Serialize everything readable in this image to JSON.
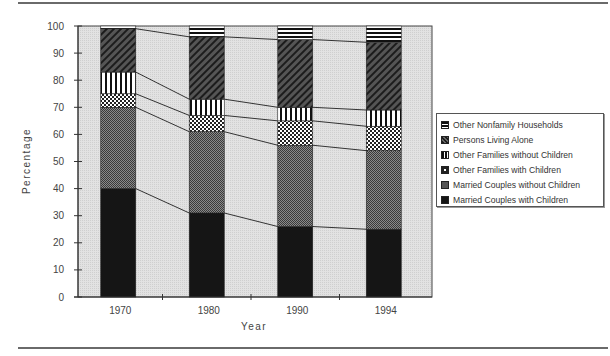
{
  "chart_data": {
    "type": "bar",
    "stacked": true,
    "percent": true,
    "title": "",
    "xlabel": "Year",
    "ylabel": "Percentage",
    "ylim": [
      0,
      100
    ],
    "yticks": [
      0,
      10,
      20,
      30,
      40,
      50,
      60,
      70,
      80,
      90,
      100
    ],
    "categories": [
      "1970",
      "1980",
      "1990",
      "1994"
    ],
    "series": [
      {
        "name": "Married Couples with Children",
        "values": [
          40,
          31,
          26,
          25
        ]
      },
      {
        "name": "Married Couples without Children",
        "values": [
          30,
          30,
          30,
          29
        ]
      },
      {
        "name": "Other Families with Children",
        "values": [
          5,
          6,
          9,
          9
        ]
      },
      {
        "name": "Other Families without Children",
        "values": [
          8,
          6,
          5,
          6
        ]
      },
      {
        "name": "Persons Living Alone",
        "values": [
          16,
          23,
          25,
          25
        ]
      },
      {
        "name": "Other Nonfamily Households",
        "values": [
          1,
          4,
          5,
          6
        ]
      }
    ],
    "grid": false,
    "legend_position": "right",
    "connector_lines": true
  },
  "axes": {
    "ylabel": "Percentage",
    "xlabel": "Year",
    "yticks": [
      "0",
      "10",
      "20",
      "30",
      "40",
      "50",
      "60",
      "70",
      "80",
      "90",
      "100"
    ],
    "xticks": [
      "1970",
      "1980",
      "1990",
      "1994"
    ]
  },
  "legend": {
    "items": [
      {
        "label": "Other Nonfamily Households",
        "icon": "horizontal-stripes-swatch"
      },
      {
        "label": "Persons Living Alone",
        "icon": "diagonal-hatch-swatch"
      },
      {
        "label": "Other Families without Children",
        "icon": "vertical-stripes-swatch"
      },
      {
        "label": "Other Families with Children",
        "icon": "checker-swatch"
      },
      {
        "label": "Married Couples without Children",
        "icon": "fine-mesh-swatch"
      },
      {
        "label": "Married Couples with Children",
        "icon": "solid-black-swatch"
      }
    ]
  },
  "colors": {
    "plot_background": "#d9d9d9",
    "bar_dark": "#1a1a1a",
    "axis": "#333333"
  }
}
